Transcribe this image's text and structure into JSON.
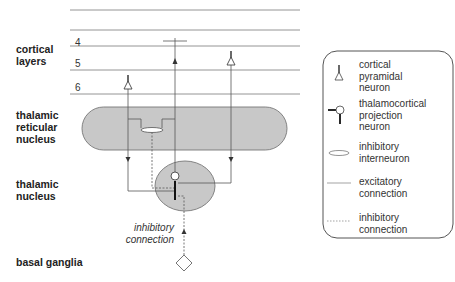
{
  "region_labels": {
    "cortical_layers": [
      "cortical",
      "layers"
    ],
    "thalamic_reticular_nucleus": [
      "thalamic",
      "reticular",
      "nucleus"
    ],
    "thalamic_nucleus": [
      "thalamic",
      "nucleus"
    ],
    "basal_ganglia": "basal ganglia"
  },
  "layer_numbers": [
    "4",
    "5",
    "6"
  ],
  "annotation": [
    "inhibitory",
    "connection"
  ],
  "legend": {
    "items": [
      {
        "icon": "cortical-pyramidal-neuron-icon",
        "label": [
          "cortical",
          "pyramidal",
          "neuron"
        ]
      },
      {
        "icon": "thalamocortical-projection-neuron-icon",
        "label": [
          "thalamocortical",
          "projection",
          "neuron"
        ]
      },
      {
        "icon": "inhibitory-interneuron-icon",
        "label": [
          "inhibitory",
          "interneuron"
        ]
      },
      {
        "icon": "excitatory-connection-icon",
        "label": [
          "excitatory",
          "connection"
        ]
      },
      {
        "icon": "inhibitory-connection-icon",
        "label": [
          "inhibitory",
          "connection"
        ]
      }
    ]
  },
  "colors": {
    "nucleus_fill": "#c8c8c8",
    "stroke": "#555555",
    "text": "#222222"
  }
}
